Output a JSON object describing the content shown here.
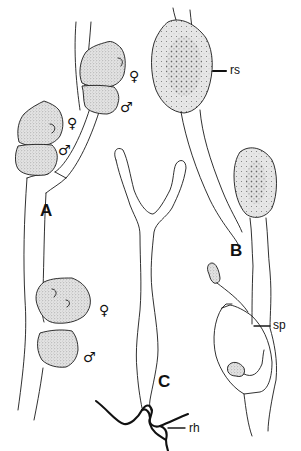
{
  "figure": {
    "panels": [
      {
        "id": "A",
        "label": "A",
        "x": 40,
        "y": 202
      },
      {
        "id": "B",
        "label": "B",
        "x": 230,
        "y": 242
      },
      {
        "id": "C",
        "label": "C",
        "x": 160,
        "y": 373
      }
    ],
    "sex_symbols": [
      {
        "label": "♀",
        "x": 127,
        "y": 68
      },
      {
        "label": "♂",
        "x": 119,
        "y": 100
      },
      {
        "label": "♀",
        "x": 68,
        "y": 116
      },
      {
        "label": "♂",
        "x": 58,
        "y": 143
      },
      {
        "label": "♀",
        "x": 99,
        "y": 301
      },
      {
        "label": "♂",
        "x": 83,
        "y": 349
      }
    ],
    "annotations": [
      {
        "id": "rs",
        "label": "rs",
        "x": 230,
        "y": 63,
        "leader": [
          213,
          71,
          228,
          71
        ]
      },
      {
        "id": "sp",
        "label": "sp",
        "x": 275,
        "y": 320,
        "leader": [
          254,
          326,
          270,
          326
        ]
      },
      {
        "id": "rh",
        "label": "rh",
        "x": 191,
        "y": 424,
        "leader": [
          168,
          428,
          185,
          428
        ]
      }
    ],
    "colors": {
      "ink": "#1a1a1a",
      "stipple_light": "#cfcfcf",
      "stipple_dark": "#555555",
      "background": "#ffffff"
    }
  }
}
